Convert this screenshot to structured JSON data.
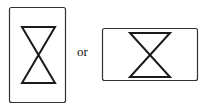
{
  "diagram": {
    "figures": [
      {
        "name": "portrait-hourglass-figure",
        "orientation": "portrait",
        "frame": {
          "x": 9.5,
          "y": 7.5,
          "w": 56,
          "h": 95
        },
        "hourglass": {
          "top_y": 27,
          "bottom_y": 83,
          "left_x": 22,
          "right_x": 55
        }
      },
      {
        "name": "landscape-hourglass-figure",
        "orientation": "landscape",
        "frame": {
          "x": 102.5,
          "y": 28.5,
          "w": 95,
          "h": 52
        },
        "hourglass": {
          "top_y": 33,
          "bottom_y": 77,
          "left_x": 130,
          "right_x": 170
        }
      }
    ],
    "connector_label": "or",
    "stroke_color": "#1a1a1a"
  }
}
